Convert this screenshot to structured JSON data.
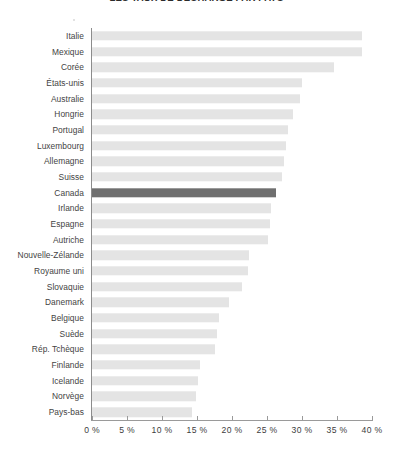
{
  "chart_data": {
    "type": "bar",
    "orientation": "horizontal",
    "title": "LES TAUX DE DÉCHARGE PAR PAYS",
    "xlabel": "",
    "ylabel": "",
    "xlim": [
      0,
      40
    ],
    "grid": false,
    "legend": null,
    "unit": "%",
    "tick_labels": [
      "0 %",
      "5 %",
      "10 %",
      "15 %",
      "20 %",
      "25 %",
      "30 %",
      "35 %",
      "40 %"
    ],
    "tick_values": [
      0,
      5,
      10,
      15,
      20,
      25,
      30,
      35,
      40
    ],
    "categories": [
      "Italie",
      "Mexique",
      "Corée",
      "États-unis",
      "Australie",
      "Hongrie",
      "Portugal",
      "Luxembourg",
      "Allemagne",
      "Suisse",
      "Canada",
      "Irlande",
      "Espagne",
      "Autriche",
      "Nouvelle-Zélande",
      "Royaume uni",
      "Slovaquie",
      "Danemark",
      "Belgique",
      "Suède",
      "Rép. Tchèque",
      "Finlande",
      "Icelande",
      "Norvège",
      "Pays-bas"
    ],
    "values": [
      38.6,
      38.6,
      34.6,
      30.0,
      29.7,
      28.7,
      28.0,
      27.7,
      27.4,
      27.1,
      26.3,
      25.6,
      25.4,
      25.1,
      22.4,
      22.3,
      21.4,
      19.6,
      18.1,
      17.9,
      17.6,
      15.4,
      15.1,
      14.9,
      14.3
    ],
    "highlight_category": "Canada",
    "colors": {
      "bar": "#e4e4e4",
      "bar_highlight": "#6f6f6f",
      "axis": "#9a9a9a",
      "text": "#3d3d3d"
    }
  }
}
